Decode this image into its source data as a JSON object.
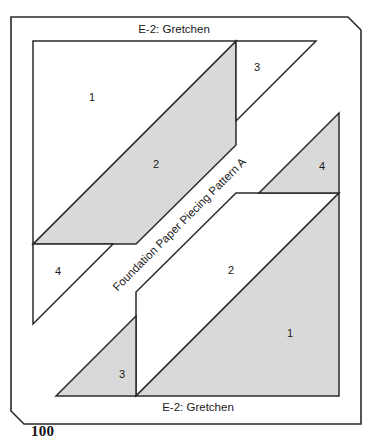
{
  "page": {
    "page_number": "100",
    "line_color": "#2b2b2b",
    "shaded_color": "#d9d9d9",
    "background_color": "#ffffff"
  },
  "block_a": {
    "title": "E-2: Gretchen",
    "band_label": "Foundation Paper Piecing Pattern A",
    "regions": [
      {
        "label": "1",
        "shaded": false
      },
      {
        "label": "2",
        "shaded": true
      },
      {
        "label": "3",
        "shaded": false
      },
      {
        "label": "4",
        "shaded": false
      }
    ]
  },
  "block_b": {
    "title": "E-2: Gretchen",
    "band_label": "Foundation Paper Piecing Pattern B",
    "regions": [
      {
        "label": "1",
        "shaded": true
      },
      {
        "label": "2",
        "shaded": false
      },
      {
        "label": "3",
        "shaded": true
      },
      {
        "label": "4",
        "shaded": true
      }
    ]
  }
}
